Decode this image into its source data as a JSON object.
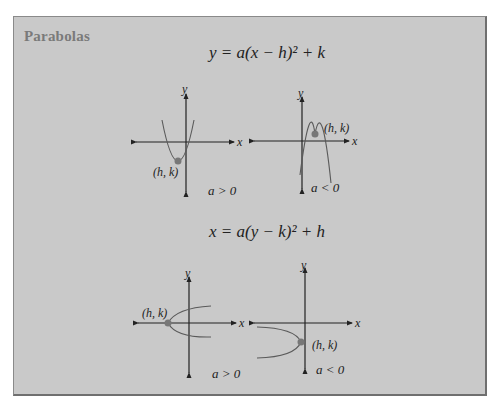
{
  "panel": {
    "title": "Parabolas",
    "colors": {
      "background": "#c9c9c9",
      "border": "#6f6f6f",
      "title": "#7a7a7a",
      "axis": "#222222",
      "curve": "#5a5a5a",
      "vertex": "#777777"
    }
  },
  "sections": [
    {
      "equation": "y = a(x − h)² + k",
      "graphs": [
        {
          "condition": "a > 0",
          "vertex_label": "(h, k)",
          "x_label": "x",
          "y_label": "y",
          "opens": "up"
        },
        {
          "condition": "a < 0",
          "vertex_label": "(h, k)",
          "x_label": "x",
          "y_label": "y",
          "opens": "down"
        }
      ]
    },
    {
      "equation": "x = a(y − k)² + h",
      "graphs": [
        {
          "condition": "a > 0",
          "vertex_label": "(h, k)",
          "x_label": "x",
          "y_label": "y",
          "opens": "right"
        },
        {
          "condition": "a < 0",
          "vertex_label": "(h, k)",
          "x_label": "x",
          "y_label": "y",
          "opens": "left"
        }
      ]
    }
  ]
}
